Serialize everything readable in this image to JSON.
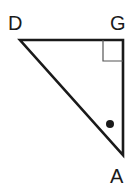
{
  "figure": {
    "background_color": "#ffffff",
    "stroke_color": "#1a1a1a",
    "marker_color": "#1a1a1a",
    "right_angle_color": "#555555",
    "width": 136,
    "height": 195
  },
  "labels": {
    "d": "D",
    "g": "G",
    "a": "A"
  },
  "chart_data": {
    "type": "diagram",
    "shape": "right triangle",
    "vertices": [
      {
        "name": "D",
        "x": 20,
        "y": 40,
        "label_x": 18,
        "label_y": 24
      },
      {
        "name": "G",
        "x": 123,
        "y": 40,
        "label_x": 120,
        "label_y": 24
      },
      {
        "name": "A",
        "x": 123,
        "y": 155,
        "label_x": 120,
        "label_y": 177
      }
    ],
    "edges": [
      {
        "from": "D",
        "to": "G",
        "kind": "leg"
      },
      {
        "from": "G",
        "to": "A",
        "kind": "leg"
      },
      {
        "from": "A",
        "to": "D",
        "kind": "hypotenuse"
      }
    ],
    "annotations": [
      {
        "kind": "right-angle-square",
        "at_vertex": "G",
        "x": 103,
        "y": 40,
        "width": 20,
        "height": 21
      },
      {
        "kind": "angle-dot-marker",
        "at_vertex": "A",
        "x": 110,
        "y": 124,
        "radius": 4
      }
    ],
    "stroke_width": 2.6
  }
}
